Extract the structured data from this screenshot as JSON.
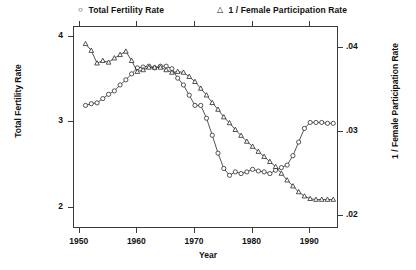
{
  "chart_data": {
    "type": "line",
    "title": "",
    "xlabel": "Year",
    "ylabel": "Total Fertility Rate",
    "ylabel_right": "1 / Female Participation Rate",
    "grid": false,
    "legend_position": "top",
    "xlim": [
      1949,
      1995
    ],
    "ylim": [
      1.75,
      4.12
    ],
    "ylim_right": [
      0.0185,
      0.0425
    ],
    "xticks": [
      1950,
      1960,
      1970,
      1980,
      1990
    ],
    "xtick_labels": [
      "1950",
      "1960",
      "1970",
      "1980",
      "1990"
    ],
    "yticks": [
      2,
      3,
      4
    ],
    "ytick_labels": [
      "2",
      "3",
      "4"
    ],
    "yticks_right": [
      0.02,
      0.03,
      0.04
    ],
    "ytick_labels_right": [
      ".02",
      ".03",
      ".04"
    ],
    "series": [
      {
        "name": "Total Fertility Rate",
        "marker": "circle",
        "axis": "left",
        "x": [
          1951,
          1952,
          1953,
          1954,
          1955,
          1956,
          1957,
          1958,
          1959,
          1960,
          1961,
          1962,
          1963,
          1964,
          1965,
          1966,
          1967,
          1968,
          1969,
          1970,
          1971,
          1972,
          1973,
          1974,
          1975,
          1976,
          1977,
          1978,
          1979,
          1980,
          1981,
          1982,
          1983,
          1984,
          1985,
          1986,
          1987,
          1988,
          1989,
          1990,
          1991,
          1992,
          1993,
          1994
        ],
        "y": [
          3.2,
          3.22,
          3.23,
          3.28,
          3.33,
          3.37,
          3.44,
          3.5,
          3.57,
          3.64,
          3.65,
          3.66,
          3.64,
          3.66,
          3.66,
          3.63,
          3.52,
          3.44,
          3.32,
          3.2,
          3.2,
          3.05,
          2.85,
          2.64,
          2.46,
          2.38,
          2.42,
          2.4,
          2.42,
          2.45,
          2.43,
          2.42,
          2.4,
          2.44,
          2.47,
          2.5,
          2.61,
          2.77,
          2.93,
          3.0,
          3.0,
          3.0,
          2.99,
          2.99
        ],
        "y_plot": [
          3.2,
          3.22,
          3.23,
          3.28,
          3.33,
          3.37,
          3.44,
          3.5,
          3.57,
          3.64,
          3.65,
          3.66,
          3.64,
          3.66,
          3.66,
          3.63,
          3.52,
          3.44,
          3.32,
          3.2,
          3.2,
          3.05,
          2.85,
          2.64,
          2.46,
          2.38,
          2.42,
          2.4,
          2.42,
          2.45,
          2.43,
          2.42,
          2.4,
          2.44,
          2.47,
          2.5,
          2.61,
          2.77,
          2.93,
          3.0,
          3.0,
          3.0,
          2.99,
          2.99
        ]
      },
      {
        "name": "1 / Female Participation Rate",
        "marker": "triangle",
        "axis": "right",
        "x": [
          1951,
          1952,
          1953,
          1954,
          1955,
          1956,
          1957,
          1958,
          1959,
          1960,
          1961,
          1962,
          1963,
          1964,
          1965,
          1966,
          1967,
          1968,
          1969,
          1970,
          1971,
          1972,
          1973,
          1974,
          1975,
          1976,
          1977,
          1978,
          1979,
          1980,
          1981,
          1982,
          1983,
          1984,
          1985,
          1986,
          1987,
          1988,
          1989,
          1990,
          1991,
          1992,
          1993,
          1994
        ],
        "y": [
          0.0405,
          0.0397,
          0.0382,
          0.0385,
          0.0383,
          0.0388,
          0.0392,
          0.0396,
          0.0385,
          0.0372,
          0.0374,
          0.0377,
          0.0377,
          0.0377,
          0.0374,
          0.0371,
          0.0372,
          0.0371,
          0.0366,
          0.036,
          0.0352,
          0.0344,
          0.0335,
          0.0327,
          0.0318,
          0.0311,
          0.0303,
          0.0296,
          0.0289,
          0.0283,
          0.0277,
          0.0271,
          0.0265,
          0.0259,
          0.0251,
          0.0243,
          0.0236,
          0.0229,
          0.0224,
          0.0221,
          0.022,
          0.022,
          0.022,
          0.022
        ]
      }
    ]
  },
  "legend": {
    "entries": [
      {
        "marker": "circle-marker",
        "glyph": "○",
        "label": "Total Fertility Rate"
      },
      {
        "marker": "triangle-marker",
        "glyph": "△",
        "label": "1 / Female Participation Rate"
      }
    ]
  },
  "axes": {
    "x_title": "Year",
    "y_left_title": "Total Fertility Rate",
    "y_right_title": "1 / Female Participation Rate",
    "x_ticks": [
      "1950",
      "1960",
      "1970",
      "1980",
      "1990"
    ],
    "y_left_ticks": [
      "4",
      "3",
      "2"
    ],
    "y_right_ticks": [
      ".04",
      ".03",
      ".02"
    ]
  },
  "colors": {
    "line": "#2b2b2b",
    "axis": "#3a3a3a",
    "text": "#111111",
    "background": "#ffffff"
  }
}
